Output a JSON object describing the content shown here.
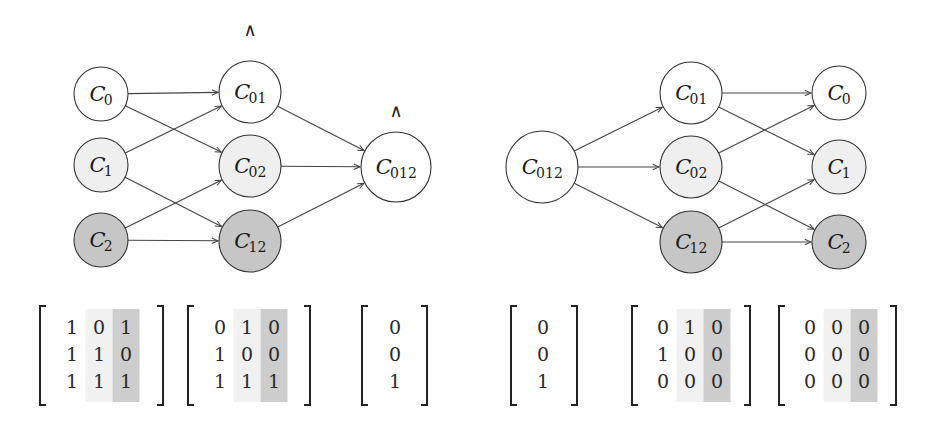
{
  "colors": {
    "white": "#ffffff",
    "light": "#efefef",
    "dark": "#c6c6c6",
    "stroke": "#333333",
    "col_light": "#f1f1f1",
    "col_dark": "#cdcdcd"
  },
  "left_graph": {
    "nodes": [
      {
        "id": "L_C0",
        "base": "C",
        "sub": "0",
        "x": 101,
        "y": 94,
        "r": 27,
        "fill": "white"
      },
      {
        "id": "L_C1",
        "base": "C",
        "sub": "1",
        "x": 101,
        "y": 165,
        "r": 27,
        "fill": "light"
      },
      {
        "id": "L_C2",
        "base": "C",
        "sub": "2",
        "x": 101,
        "y": 240,
        "r": 27,
        "fill": "dark"
      },
      {
        "id": "L_C01",
        "base": "C",
        "sub": "01",
        "x": 250,
        "y": 92,
        "r": 31,
        "fill": "white"
      },
      {
        "id": "L_C02",
        "base": "C",
        "sub": "02",
        "x": 250,
        "y": 166,
        "r": 31,
        "fill": "light"
      },
      {
        "id": "L_C12",
        "base": "C",
        "sub": "12",
        "x": 250,
        "y": 241,
        "r": 31,
        "fill": "dark"
      },
      {
        "id": "L_C012",
        "base": "C",
        "sub": "012",
        "x": 396,
        "y": 167,
        "r": 35,
        "fill": "white"
      }
    ],
    "edges": [
      [
        "L_C0",
        "L_C01"
      ],
      [
        "L_C0",
        "L_C02"
      ],
      [
        "L_C1",
        "L_C01"
      ],
      [
        "L_C1",
        "L_C12"
      ],
      [
        "L_C2",
        "L_C02"
      ],
      [
        "L_C2",
        "L_C12"
      ],
      [
        "L_C01",
        "L_C012"
      ],
      [
        "L_C02",
        "L_C012"
      ],
      [
        "L_C12",
        "L_C012"
      ]
    ],
    "wedges": [
      {
        "symbol": "∧",
        "x": 250,
        "y": 36
      },
      {
        "symbol": "∧",
        "x": 396,
        "y": 117
      }
    ]
  },
  "right_graph": {
    "nodes": [
      {
        "id": "R_C012",
        "base": "C",
        "sub": "012",
        "x": 542,
        "y": 167,
        "r": 36,
        "fill": "white"
      },
      {
        "id": "R_C01",
        "base": "C",
        "sub": "01",
        "x": 691,
        "y": 93,
        "r": 31,
        "fill": "white"
      },
      {
        "id": "R_C02",
        "base": "C",
        "sub": "02",
        "x": 691,
        "y": 167,
        "r": 31,
        "fill": "light"
      },
      {
        "id": "R_C12",
        "base": "C",
        "sub": "12",
        "x": 691,
        "y": 242,
        "r": 31,
        "fill": "dark"
      },
      {
        "id": "R_C0",
        "base": "C",
        "sub": "0",
        "x": 839,
        "y": 93,
        "r": 27,
        "fill": "white"
      },
      {
        "id": "R_C1",
        "base": "C",
        "sub": "1",
        "x": 839,
        "y": 167,
        "r": 27,
        "fill": "light"
      },
      {
        "id": "R_C2",
        "base": "C",
        "sub": "2",
        "x": 839,
        "y": 242,
        "r": 27,
        "fill": "dark"
      }
    ],
    "edges": [
      [
        "R_C012",
        "R_C01"
      ],
      [
        "R_C012",
        "R_C02"
      ],
      [
        "R_C012",
        "R_C12"
      ],
      [
        "R_C01",
        "R_C0"
      ],
      [
        "R_C01",
        "R_C1"
      ],
      [
        "R_C02",
        "R_C0"
      ],
      [
        "R_C02",
        "R_C2"
      ],
      [
        "R_C12",
        "R_C1"
      ],
      [
        "R_C12",
        "R_C2"
      ]
    ]
  },
  "matrices": [
    {
      "id": "M1",
      "left": 40,
      "right": 163,
      "col_x": [
        72,
        99,
        126
      ],
      "shade": [
        null,
        "light",
        "dark"
      ],
      "values": [
        [
          "1",
          "0",
          "1"
        ],
        [
          "1",
          "1",
          "0"
        ],
        [
          "1",
          "1",
          "1"
        ]
      ]
    },
    {
      "id": "M2",
      "left": 188,
      "right": 310,
      "col_x": [
        220,
        247,
        274
      ],
      "shade": [
        null,
        "light",
        "dark"
      ],
      "values": [
        [
          "0",
          "1",
          "0"
        ],
        [
          "1",
          "0",
          "0"
        ],
        [
          "1",
          "1",
          "1"
        ]
      ]
    },
    {
      "id": "V1",
      "left": 362,
      "right": 427,
      "col_x": [
        395
      ],
      "shade": [
        null
      ],
      "values": [
        [
          "0"
        ],
        [
          "0"
        ],
        [
          "1"
        ]
      ]
    },
    {
      "id": "V2",
      "left": 511,
      "right": 577,
      "col_x": [
        543
      ],
      "shade": [
        null
      ],
      "values": [
        [
          "0"
        ],
        [
          "0"
        ],
        [
          "1"
        ]
      ]
    },
    {
      "id": "M3",
      "left": 632,
      "right": 750,
      "col_x": [
        663,
        690,
        717
      ],
      "shade": [
        null,
        "light",
        "dark"
      ],
      "values": [
        [
          "0",
          "1",
          "0"
        ],
        [
          "1",
          "0",
          "0"
        ],
        [
          "0",
          "0",
          "0"
        ]
      ]
    },
    {
      "id": "M4",
      "left": 779,
      "right": 896,
      "col_x": [
        810,
        837,
        864
      ],
      "shade": [
        null,
        "light",
        "dark"
      ],
      "values": [
        [
          "0",
          "0",
          "0"
        ],
        [
          "0",
          "0",
          "0"
        ],
        [
          "0",
          "0",
          "0"
        ]
      ]
    }
  ],
  "matrix_layout": {
    "top": 306,
    "bottom": 405,
    "row_y": [
      327,
      354,
      381
    ],
    "col_w": 27
  }
}
